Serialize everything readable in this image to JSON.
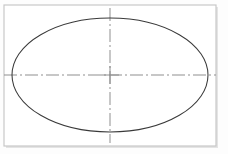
{
  "figure": {
    "title": "Ellipse with centerlines",
    "type": "technical-line-drawing",
    "width": 228,
    "height": 154,
    "background_color": "#fdfdfd",
    "page_color": "#ffffff"
  },
  "frame": {
    "name": "drawing-border",
    "x": 4,
    "y": 5,
    "width": 212,
    "height": 141,
    "stroke_color": "#c8c8c8",
    "stroke_width": 1.2,
    "fill_color": "#ffffff",
    "shadow_color": "#b4b4b4"
  },
  "ellipse": {
    "name": "ellipse-outline",
    "center_x": 110,
    "center_y": 75,
    "radius_x": 98,
    "radius_y": 57,
    "stroke_color": "#3a3a3a",
    "stroke_width": 1.05,
    "fill": "none"
  },
  "centerlines": {
    "pattern": "dash-dot",
    "dash_array": "13,3,2,3",
    "stroke_color": "#8f8f8f",
    "stroke_width": 1.0,
    "horizontal": {
      "name": "major-axis-centerline",
      "x1": 4,
      "y1": 75,
      "x2": 216,
      "y2": 75,
      "label": "major axis"
    },
    "vertical": {
      "name": "minor-axis-centerline",
      "x1": 110,
      "y1": 8,
      "x2": 110,
      "y2": 143,
      "label": "minor axis"
    }
  },
  "center_mark": {
    "name": "center-intersection",
    "x": 110,
    "y": 75
  }
}
